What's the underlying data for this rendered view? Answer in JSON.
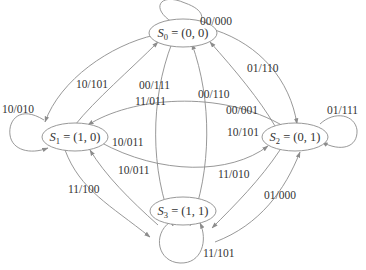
{
  "diagram": {
    "type": "state-transition-diagram",
    "colors": {
      "edge": "#8c8c8c",
      "text": "#333333",
      "background": "#ffffff"
    },
    "states": [
      {
        "id": "S0",
        "sym": "S",
        "sub": "0",
        "eq": " = (0, 0)"
      },
      {
        "id": "S1",
        "sym": "S",
        "sub": "1",
        "eq": " = (1, 0)"
      },
      {
        "id": "S2",
        "sym": "S",
        "sub": "2",
        "eq": " = (0, 1)"
      },
      {
        "id": "S3",
        "sym": "S",
        "sub": "3",
        "eq": " = (1, 1)"
      }
    ],
    "transitions": [
      {
        "from": "S0",
        "to": "S0",
        "label": "00/000"
      },
      {
        "from": "S1",
        "to": "S1",
        "label": "10/010"
      },
      {
        "from": "S2",
        "to": "S2",
        "label": "01/111"
      },
      {
        "from": "S3",
        "to": "S3",
        "label": "11/101"
      },
      {
        "from": "S0",
        "to": "S1",
        "label": "10/101"
      },
      {
        "from": "S1",
        "to": "S0",
        "label": "11/011"
      },
      {
        "from": "S0",
        "to": "S2",
        "label": "01/110"
      },
      {
        "from": "S2",
        "to": "S0",
        "label": "00/001"
      },
      {
        "from": "S0",
        "to": "S3",
        "label": "00/111"
      },
      {
        "from": "S3",
        "to": "S0",
        "label": "00/110"
      },
      {
        "from": "S2",
        "to": "S1",
        "label": "10/101"
      },
      {
        "from": "S1",
        "to": "S2",
        "label": "10/011"
      },
      {
        "from": "S3",
        "to": "S1",
        "label": "10/011"
      },
      {
        "from": "S1",
        "to": "S3",
        "label": "11/100"
      },
      {
        "from": "S2",
        "to": "S3",
        "label": "11/010"
      },
      {
        "from": "S3",
        "to": "S2",
        "label": "01/000"
      }
    ]
  }
}
